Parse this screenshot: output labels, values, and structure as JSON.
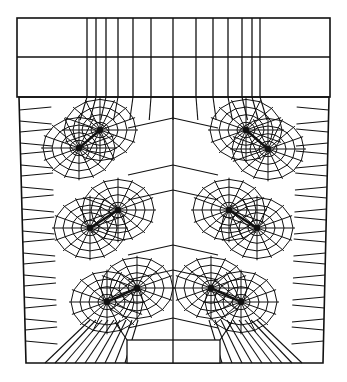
{
  "diagram": {
    "type": "finite-element-mesh",
    "stroke_color": "#111111",
    "background": "#ffffff",
    "canvas": {
      "width": 347,
      "height": 382
    },
    "top_block": {
      "x0": 17,
      "x1": 330,
      "y0": 18,
      "ymid": 57,
      "y1": 97,
      "vertical_lines_x": [
        87,
        96,
        106,
        118,
        133,
        151,
        173,
        196,
        213,
        228,
        242,
        252,
        260
      ]
    },
    "body": {
      "top_left": [
        19,
        97
      ],
      "top_right": [
        329,
        97
      ],
      "bottom_left": [
        26,
        363
      ],
      "bottom_right": [
        323,
        363
      ],
      "center_x": 173
    },
    "bottom_box": {
      "x0": 127,
      "x1": 220,
      "y0": 340,
      "y1": 363
    },
    "crack_pairs": [
      {
        "name": "upper-left",
        "a": [
          100,
          130
        ],
        "b": [
          79,
          148
        ]
      },
      {
        "name": "upper-right",
        "a": [
          246,
          130
        ],
        "b": [
          268,
          149
        ]
      },
      {
        "name": "middle-left",
        "a": [
          118,
          210
        ],
        "b": [
          90,
          228
        ]
      },
      {
        "name": "middle-right",
        "a": [
          229,
          210
        ],
        "b": [
          257,
          228
        ]
      },
      {
        "name": "lower-left",
        "a": [
          137,
          288
        ],
        "b": [
          107,
          302
        ]
      },
      {
        "name": "lower-right",
        "a": [
          211,
          288
        ],
        "b": [
          241,
          302
        ]
      }
    ],
    "rays_per_node": 16,
    "rings_per_node": 4
  }
}
